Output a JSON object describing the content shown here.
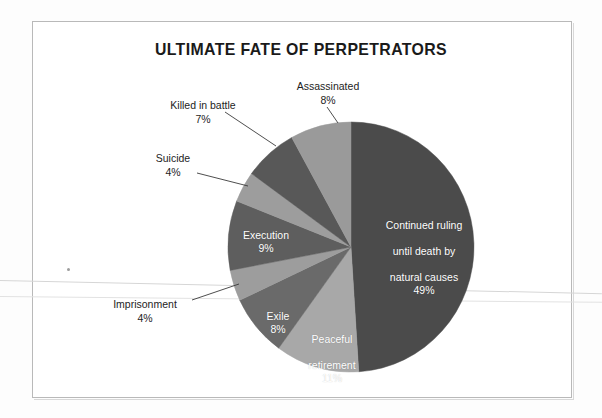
{
  "page": {
    "frame_color": "#b9b9b9",
    "background": "#ffffff"
  },
  "chart_data": {
    "type": "pie",
    "title": "ULTIMATE FATE OF PERPETRATORS",
    "xlabel": "",
    "ylabel": "",
    "units": "percent",
    "total": 100,
    "start_angle_deg": 0,
    "direction": "clockwise",
    "legend": "none (direct labels)",
    "grid": false,
    "categories": [
      "Continued ruling until death by natural causes",
      "Peaceful retirement",
      "Exile",
      "Imprisonment",
      "Execution",
      "Suicide",
      "Killed in battle",
      "Assassinated"
    ],
    "values": [
      49,
      11,
      8,
      4,
      9,
      4,
      7,
      8
    ],
    "slices": [
      {
        "label": "Continued ruling\nuntil death by\nnatural causes",
        "label_flat": "Continued ruling until death by natural causes",
        "value": 49,
        "percent_text": "49%",
        "color": "#4b4b4b",
        "label_placement": "inside",
        "label_color": "#ffffff"
      },
      {
        "label": "Peaceful\nretirement",
        "label_flat": "Peaceful retirement",
        "value": 11,
        "percent_text": "11%",
        "color": "#a8a8a8",
        "label_placement": "inside",
        "label_color": "#ffffff"
      },
      {
        "label": "Exile",
        "label_flat": "Exile",
        "value": 8,
        "percent_text": "8%",
        "color": "#6a6a6a",
        "label_placement": "inside",
        "label_color": "#ffffff"
      },
      {
        "label": "Imprisonment",
        "label_flat": "Imprisonment",
        "value": 4,
        "percent_text": "4%",
        "color": "#9d9d9d",
        "label_placement": "outside",
        "label_color": "#1d1d1d"
      },
      {
        "label": "Execution",
        "label_flat": "Execution",
        "value": 9,
        "percent_text": "9%",
        "color": "#5e5e5e",
        "label_placement": "inside",
        "label_color": "#ffffff"
      },
      {
        "label": "Suicide",
        "label_flat": "Suicide",
        "value": 4,
        "percent_text": "4%",
        "color": "#9d9d9d",
        "label_placement": "outside",
        "label_color": "#1d1d1d"
      },
      {
        "label": "Killed in battle",
        "label_flat": "Killed in battle",
        "value": 7,
        "percent_text": "7%",
        "color": "#585858",
        "label_placement": "outside",
        "label_color": "#1d1d1d"
      },
      {
        "label": "Assassinated",
        "label_flat": "Assassinated",
        "value": 8,
        "percent_text": "8%",
        "color": "#9a9a9a",
        "label_placement": "outside",
        "label_color": "#1d1d1d"
      }
    ]
  },
  "inside_labels": {
    "continued": {
      "line1": "Continued ruling",
      "line2": "until death by",
      "line3": "natural causes",
      "pct": "49%"
    },
    "peaceful": {
      "line1": "Peaceful",
      "line2": "retirement",
      "pct": "11%"
    },
    "exile": {
      "line1": "Exile",
      "pct": "8%"
    },
    "execution": {
      "line1": "Execution",
      "pct": "9%"
    }
  },
  "callouts": {
    "assassinated": {
      "name": "Assassinated",
      "pct": "8%"
    },
    "killed_in_battle": {
      "name": "Killed in battle",
      "pct": "7%"
    },
    "suicide": {
      "name": "Suicide",
      "pct": "4%"
    },
    "imprisonment": {
      "name": "Imprisonment",
      "pct": "4%"
    }
  }
}
